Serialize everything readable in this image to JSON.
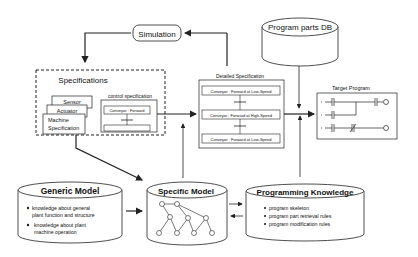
{
  "simulation": {
    "label": "Simulation"
  },
  "program_parts_db": {
    "label": "Program parts DB"
  },
  "specifications": {
    "title": "Specifications",
    "stack": [
      "Sensor",
      "Actuator",
      "Machine",
      "Specification"
    ],
    "control_spec": {
      "title": "control specification",
      "step1": "Conveyor : Forward"
    }
  },
  "detailed_spec": {
    "title": "Detailed Specification",
    "steps": [
      "Conveyor : Forward at Low-Speed",
      "Conveyor : Forward at High-Speed",
      "Conveyor : Forward at Low-Speed"
    ]
  },
  "target_program": {
    "title": "Target Program"
  },
  "generic_model": {
    "title": "Generic Model",
    "bullets": [
      [
        "knowledge about general",
        "plant function and structure"
      ],
      [
        "knowledge about plant",
        "machine operation"
      ]
    ]
  },
  "specific_model": {
    "title": "Specific Model"
  },
  "programming_knowledge": {
    "title": "Programming Knowledge",
    "bullets": [
      "program skeleton",
      "program part retrieval rules",
      "program modification rules"
    ]
  },
  "colors": {
    "stroke": "#222222",
    "background": "#ffffff"
  }
}
